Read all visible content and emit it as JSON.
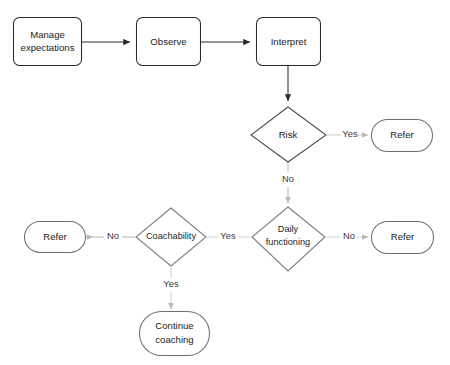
{
  "diagram": {
    "title_fragment": "",
    "nodes": [
      {
        "id": "manage",
        "kind": "process",
        "lines": [
          "Manage",
          "expectations"
        ]
      },
      {
        "id": "observe",
        "kind": "process",
        "lines": [
          "Observe"
        ]
      },
      {
        "id": "interpret",
        "kind": "process",
        "lines": [
          "Interpret"
        ]
      },
      {
        "id": "risk",
        "kind": "decision",
        "lines": [
          "Risk"
        ]
      },
      {
        "id": "refer_risk",
        "kind": "terminal",
        "lines": [
          "Refer"
        ]
      },
      {
        "id": "daily",
        "kind": "decision",
        "lines": [
          "Daily",
          "functioning"
        ]
      },
      {
        "id": "refer_daily",
        "kind": "terminal",
        "lines": [
          "Refer"
        ]
      },
      {
        "id": "coach",
        "kind": "decision",
        "lines": [
          "Coachability"
        ]
      },
      {
        "id": "refer_coach",
        "kind": "terminal",
        "lines": [
          "Refer"
        ]
      },
      {
        "id": "continue",
        "kind": "terminal",
        "lines": [
          "Continue",
          "coaching"
        ]
      }
    ],
    "edges": [
      {
        "from": "manage",
        "to": "observe",
        "label": ""
      },
      {
        "from": "observe",
        "to": "interpret",
        "label": ""
      },
      {
        "from": "interpret",
        "to": "risk",
        "label": ""
      },
      {
        "from": "risk",
        "to": "refer_risk",
        "label": "Yes"
      },
      {
        "from": "risk",
        "to": "daily",
        "label": "No"
      },
      {
        "from": "daily",
        "to": "refer_daily",
        "label": "No"
      },
      {
        "from": "daily",
        "to": "coach",
        "label": "Yes"
      },
      {
        "from": "coach",
        "to": "refer_coach",
        "label": "No"
      },
      {
        "from": "coach",
        "to": "continue",
        "label": "Yes"
      }
    ],
    "labels": {
      "manage_line1": "Manage",
      "manage_line2": "expectations",
      "observe": "Observe",
      "interpret": "Interpret",
      "risk": "Risk",
      "refer_risk": "Refer",
      "daily_line1": "Daily",
      "daily_line2": "functioning",
      "refer_daily": "Refer",
      "coach": "Coachability",
      "refer_coach": "Refer",
      "continue_line1": "Continue",
      "continue_line2": "coaching",
      "yes_risk": "Yes",
      "no_risk": "No",
      "no_daily": "No",
      "yes_daily": "Yes",
      "no_coach": "No",
      "yes_coach": "Yes"
    },
    "colors": {
      "background": "#ffffff",
      "stroke_dark": "#2b2b2b",
      "stroke_mid": "#6b6b6b",
      "stroke_light": "#b3b3b3",
      "text": "#1c1c1c",
      "edge_label_text": "#3a3a3a"
    }
  }
}
